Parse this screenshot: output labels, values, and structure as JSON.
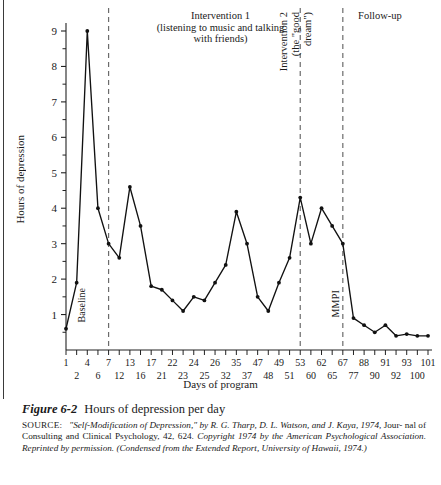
{
  "figure": {
    "number": "Figure 6-2",
    "title": "Hours of depression per day",
    "source_lead": "SOURCE:",
    "source_body_1": "\"Self-Modification of Depression,\" by R. G. Tharp, D. L. Watson, and J. Kaya, 1974,",
    "source_roman_1": "Jour-",
    "source_roman_2": "nal of Consulting and Clinical Psychology, 42, 624.",
    "source_body_2": "Copyright 1974 by the American Psychological Association. Reprinted by permission. (Condensed from the Extended Report, University of Hawaii, 1974.)"
  },
  "annotations": {
    "phase1_line1": "Intervention 1",
    "phase1_line2": "(listening to music and talking",
    "phase1_line3": "with friends)",
    "phase2_line1": "Intervention 2",
    "phase2_line2": "(the \"good",
    "phase2_line3": "dream\")",
    "phase3": "Follow-up",
    "baseline": "Baseline",
    "mmpi": "MMPI"
  },
  "chart_data": {
    "type": "line",
    "title": "Hours of depression per day",
    "xlabel": "Days of program",
    "ylabel": "Hours of depression",
    "ylim": [
      0,
      9.5
    ],
    "yticks": [
      1,
      2,
      3,
      4,
      5,
      6,
      7,
      8,
      9
    ],
    "yticks_minor_step": 0.5,
    "grid": false,
    "legend": "none",
    "marker": "filled-circle",
    "line_color": "#111111",
    "xtick_labels_top": [
      1,
      4,
      7,
      13,
      17,
      22,
      24,
      26,
      35,
      47,
      49,
      53,
      62,
      67,
      88,
      91,
      93,
      101
    ],
    "xtick_labels_bottom": [
      2,
      6,
      12,
      16,
      21,
      23,
      25,
      32,
      37,
      48,
      51,
      60,
      65,
      77,
      90,
      92,
      100
    ],
    "phase_dividers_days": [
      7,
      53,
      67
    ],
    "x": [
      1,
      2,
      4,
      6,
      7,
      12,
      13,
      16,
      17,
      21,
      22,
      23,
      24,
      25,
      26,
      32,
      35,
      37,
      47,
      48,
      49,
      51,
      53,
      60,
      62,
      65,
      67,
      77,
      88,
      90,
      91,
      92,
      93,
      100,
      101
    ],
    "y": [
      0.6,
      1.9,
      9.0,
      4.0,
      3.0,
      2.6,
      4.6,
      3.5,
      1.8,
      1.7,
      1.4,
      1.1,
      1.5,
      1.4,
      1.9,
      2.4,
      3.9,
      3.0,
      1.5,
      1.1,
      1.9,
      2.6,
      4.3,
      3.0,
      4.0,
      3.5,
      3.0,
      0.9,
      0.7,
      0.5,
      0.7,
      0.4,
      0.45,
      0.4,
      0.4
    ],
    "series_note_points": [
      {
        "day": 1,
        "hours": 0.6
      },
      {
        "day": 2,
        "hours": 1.9
      },
      {
        "day": 4,
        "hours": 9.0
      },
      {
        "day": 6,
        "hours": 4.0
      },
      {
        "day": 7,
        "hours": 3.0
      },
      {
        "day": 12,
        "hours": 2.6
      },
      {
        "day": 13,
        "hours": 4.6
      },
      {
        "day": 16,
        "hours": 3.5
      },
      {
        "day": 17,
        "hours": 1.8
      },
      {
        "day": 21,
        "hours": 1.7
      },
      {
        "day": 22,
        "hours": 1.4
      },
      {
        "day": 23,
        "hours": 1.1
      },
      {
        "day": 24,
        "hours": 1.5
      },
      {
        "day": 25,
        "hours": 1.4
      },
      {
        "day": 26,
        "hours": 1.9
      },
      {
        "day": 32,
        "hours": 2.4
      },
      {
        "day": 35,
        "hours": 3.9
      },
      {
        "day": 37,
        "hours": 3.0
      },
      {
        "day": 47,
        "hours": 1.5
      },
      {
        "day": 48,
        "hours": 1.1
      },
      {
        "day": 49,
        "hours": 1.9
      },
      {
        "day": 51,
        "hours": 2.6
      },
      {
        "day": 53,
        "hours": 4.3
      },
      {
        "day": 60,
        "hours": 3.0
      },
      {
        "day": 62,
        "hours": 4.0
      },
      {
        "day": 65,
        "hours": 3.5
      },
      {
        "day": 67,
        "hours": 3.0
      },
      {
        "day": 77,
        "hours": 0.9
      },
      {
        "day": 88,
        "hours": 0.7
      },
      {
        "day": 90,
        "hours": 0.5
      },
      {
        "day": 91,
        "hours": 0.7
      },
      {
        "day": 92,
        "hours": 0.4
      },
      {
        "day": 93,
        "hours": 0.45
      },
      {
        "day": 100,
        "hours": 0.4
      },
      {
        "day": 101,
        "hours": 0.4
      }
    ]
  },
  "colors": {
    "ink": "#1a1a1a",
    "line": "#111111",
    "dashed": "#6b6b6b",
    "axis": "#222222"
  }
}
